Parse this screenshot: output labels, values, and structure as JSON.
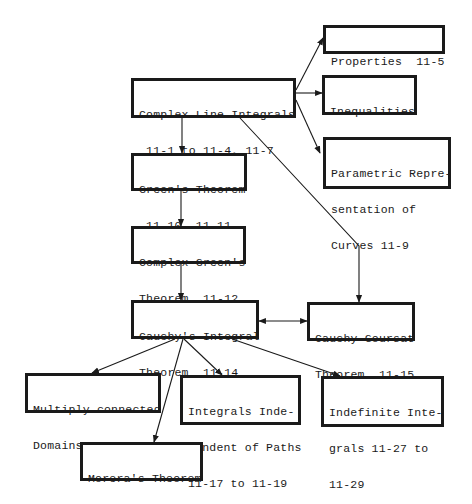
{
  "nodes": {
    "complex_line_integrals": {
      "lines": [
        "Complex Line Integrals",
        " 11-1 to 11-4, 11-7"
      ],
      "x": 131,
      "y": 78,
      "w": 165,
      "h": 40
    },
    "properties": {
      "lines": [
        "Properties  11-5"
      ],
      "x": 323,
      "y": 25,
      "w": 122,
      "h": 29
    },
    "inequalities": {
      "lines": [
        "Inequalities",
        "11-6, 11-8"
      ],
      "x": 322,
      "y": 75,
      "w": 95,
      "h": 40
    },
    "parametric": {
      "lines": [
        "Parametric Repre-",
        "sentation of",
        "Curves 11-9"
      ],
      "x": 323,
      "y": 137,
      "w": 128,
      "h": 52
    },
    "greens_theorem": {
      "lines": [
        "Green's Theorem",
        " 11-10, 11-11"
      ],
      "x": 131,
      "y": 153,
      "w": 116,
      "h": 38
    },
    "complex_greens": {
      "lines": [
        "Complex Green's",
        "Theorem  11-12"
      ],
      "x": 131,
      "y": 226,
      "w": 115,
      "h": 38
    },
    "cauchy_integral": {
      "lines": [
        "Cauchy's Integral",
        "Theorem  11-14"
      ],
      "x": 131,
      "y": 300,
      "w": 128,
      "h": 39
    },
    "cauchy_goursat": {
      "lines": [
        "Cauchy-Goursat",
        "Theorem  11-15"
      ],
      "x": 307,
      "y": 302,
      "w": 108,
      "h": 39
    },
    "multiply_connected": {
      "lines": [
        "Multiply-connected",
        "Domains  11-16"
      ],
      "x": 25,
      "y": 373,
      "w": 136,
      "h": 40
    },
    "integrals_independent": {
      "lines": [
        "Integrals Inde-",
        "pendent of Paths",
        "11-17 to 11-19"
      ],
      "x": 180,
      "y": 375,
      "w": 121,
      "h": 50
    },
    "indefinite_integrals": {
      "lines": [
        "Indefinite Inte-",
        "grals 11-27 to",
        "11-29"
      ],
      "x": 321,
      "y": 376,
      "w": 123,
      "h": 51
    },
    "morera": {
      "lines": [
        "Morera's Theorem",
        "    11-22"
      ],
      "x": 80,
      "y": 442,
      "w": 123,
      "h": 39
    }
  },
  "edges": [
    {
      "from": "complex_line_integrals",
      "to": "properties",
      "points": [
        [
          296,
          90
        ],
        [
          323,
          38
        ]
      ]
    },
    {
      "from": "complex_line_integrals",
      "to": "inequalities",
      "points": [
        [
          296,
          93
        ],
        [
          322,
          93
        ]
      ]
    },
    {
      "from": "complex_line_integrals",
      "to": "parametric",
      "points": [
        [
          296,
          100
        ],
        [
          320,
          153
        ]
      ]
    },
    {
      "from": "complex_line_integrals",
      "to": "greens_theorem",
      "points": [
        [
          182,
          118
        ],
        [
          182,
          153
        ]
      ]
    },
    {
      "from": "complex_line_integrals",
      "to": "cauchy_goursat",
      "points": [
        [
          240,
          118
        ],
        [
          359,
          246
        ],
        [
          359,
          302
        ]
      ]
    },
    {
      "from": "greens_theorem",
      "to": "complex_greens",
      "points": [
        [
          181,
          191
        ],
        [
          181,
          226
        ]
      ]
    },
    {
      "from": "complex_greens",
      "to": "cauchy_integral",
      "points": [
        [
          181,
          264
        ],
        [
          181,
          300
        ]
      ]
    },
    {
      "from": "cauchy_integral",
      "to": "cauchy_goursat",
      "points": [
        [
          259,
          321
        ],
        [
          307,
          321
        ]
      ],
      "bidirectional": true
    },
    {
      "from": "cauchy_integral",
      "to": "multiply_connected",
      "points": [
        [
          175,
          339
        ],
        [
          92,
          373
        ]
      ]
    },
    {
      "from": "cauchy_integral",
      "to": "morera",
      "points": [
        [
          183,
          339
        ],
        [
          154,
          442
        ]
      ]
    },
    {
      "from": "cauchy_integral",
      "to": "integrals_independent",
      "points": [
        [
          184,
          339
        ],
        [
          222,
          375
        ]
      ]
    },
    {
      "from": "cauchy_integral",
      "to": "indefinite_integrals",
      "points": [
        [
          232,
          339
        ],
        [
          340,
          376
        ]
      ]
    }
  ],
  "colors": {
    "stroke": "#1a1a1a",
    "background": "#ffffff"
  }
}
